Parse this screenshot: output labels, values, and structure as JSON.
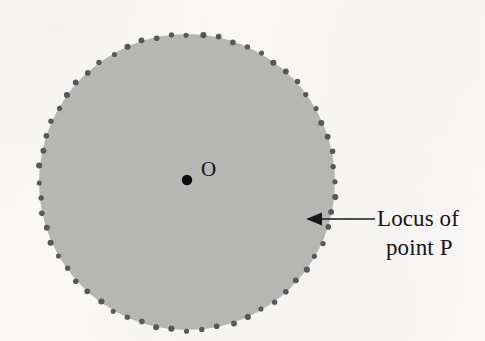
{
  "figure": {
    "kind": "geometry-locus-diagram",
    "caption_lines": [
      "Locus of",
      "point P"
    ],
    "center_label": "O",
    "colors": {
      "page_background": "#fbfaf8",
      "disk_fill": "#b6b6b4",
      "locus_dot": "#585858",
      "center_point": "#0d0d0d",
      "arrow": "#181818",
      "text": "#141414"
    },
    "geometry": {
      "circle_center_x": 187,
      "circle_center_y": 182,
      "circle_radius": 148,
      "locus_dot_count": 60,
      "locus_dot_radius": 2.8,
      "center_point_radius": 5.2,
      "arrow_tip_x": 306,
      "arrow_tip_y": 219,
      "arrow_tail_x": 375,
      "arrow_tail_y": 219
    }
  }
}
